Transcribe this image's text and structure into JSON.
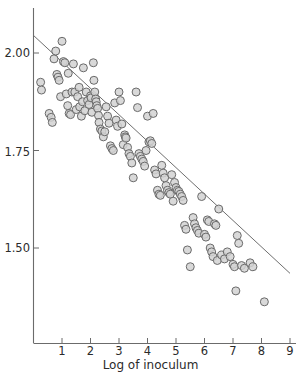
{
  "figure": {
    "background_color": "#ffffff",
    "axis_color": "#6b6b6b",
    "marker_fill": "#d2d2d2",
    "marker_stroke": "#6a6a6a",
    "fitline_color": "#6f6f6f"
  },
  "chart_data": {
    "type": "scatter",
    "title": "",
    "xlabel": "Log of inoculum",
    "ylabel": "",
    "xlim": [
      0,
      9
    ],
    "ylim": [
      1.36,
      2.08
    ],
    "grid": false,
    "legend": null,
    "xticks": [
      1,
      2,
      3,
      4,
      5,
      6,
      7,
      8,
      9
    ],
    "xtick_labels": [
      "1",
      "2",
      "3",
      "4",
      "5",
      "6",
      "7",
      "8",
      "9"
    ],
    "yticks": [
      1.5,
      1.75,
      2.0
    ],
    "ytick_labels": [
      "1.50",
      "1.75",
      "2.00"
    ],
    "series": [
      {
        "name": "observations",
        "marker": "open-circle-gray",
        "x": [
          0.25,
          0.28,
          0.55,
          0.62,
          0.66,
          0.72,
          0.78,
          0.82,
          0.86,
          0.9,
          0.95,
          1.0,
          1.05,
          1.1,
          1.15,
          1.2,
          1.22,
          1.25,
          1.3,
          1.35,
          1.4,
          1.45,
          1.5,
          1.55,
          1.6,
          1.62,
          1.68,
          1.72,
          1.75,
          1.8,
          1.85,
          1.9,
          1.95,
          2.0,
          2.02,
          2.05,
          2.1,
          2.12,
          2.15,
          2.18,
          2.2,
          2.22,
          2.25,
          2.28,
          2.3,
          2.35,
          2.4,
          2.45,
          2.5,
          2.55,
          2.6,
          2.65,
          2.7,
          2.75,
          2.8,
          2.85,
          2.9,
          2.95,
          3.0,
          3.05,
          3.1,
          3.15,
          3.2,
          3.22,
          3.25,
          3.3,
          3.35,
          3.4,
          3.45,
          3.5,
          3.6,
          3.65,
          3.7,
          3.75,
          3.8,
          3.85,
          3.9,
          3.95,
          4.0,
          4.05,
          4.1,
          4.15,
          4.2,
          4.25,
          4.3,
          4.35,
          4.4,
          4.45,
          4.5,
          4.55,
          4.6,
          4.65,
          4.7,
          4.75,
          4.8,
          4.85,
          4.9,
          4.95,
          5.0,
          5.05,
          5.1,
          5.15,
          5.2,
          5.25,
          5.3,
          5.35,
          5.4,
          5.5,
          5.6,
          5.65,
          5.7,
          5.75,
          5.8,
          5.9,
          6.0,
          6.05,
          6.1,
          6.15,
          6.2,
          6.25,
          6.3,
          6.35,
          6.4,
          6.45,
          6.5,
          6.6,
          6.7,
          6.8,
          6.9,
          7.0,
          7.05,
          7.1,
          7.15,
          7.2,
          7.3,
          7.4,
          7.6,
          7.7,
          8.1
        ],
        "y": [
          1.925,
          1.905,
          1.845,
          1.835,
          1.822,
          1.985,
          2.005,
          1.945,
          1.938,
          1.93,
          1.888,
          2.03,
          1.978,
          1.975,
          1.895,
          1.865,
          1.948,
          1.845,
          1.842,
          1.9,
          1.972,
          1.9,
          1.855,
          1.888,
          1.912,
          1.862,
          1.838,
          1.875,
          1.962,
          1.852,
          1.9,
          1.878,
          1.868,
          1.89,
          1.885,
          1.848,
          1.975,
          1.93,
          1.9,
          1.882,
          1.875,
          1.865,
          1.858,
          1.84,
          1.822,
          1.805,
          1.8,
          1.785,
          1.798,
          1.862,
          1.838,
          1.82,
          1.762,
          1.755,
          1.75,
          1.872,
          1.828,
          1.812,
          1.9,
          1.878,
          1.818,
          1.765,
          1.79,
          1.785,
          1.782,
          1.758,
          1.742,
          1.735,
          1.718,
          1.68,
          1.9,
          1.86,
          1.742,
          1.735,
          1.728,
          1.722,
          1.71,
          1.75,
          1.838,
          1.772,
          1.775,
          1.768,
          1.845,
          1.7,
          1.69,
          1.648,
          1.638,
          1.635,
          1.712,
          1.692,
          1.68,
          1.66,
          1.648,
          1.642,
          1.638,
          1.688,
          1.62,
          1.668,
          1.655,
          1.648,
          1.645,
          1.638,
          1.632,
          1.622,
          1.558,
          1.548,
          1.495,
          1.452,
          1.578,
          1.562,
          1.552,
          1.545,
          1.538,
          1.632,
          1.535,
          1.528,
          1.572,
          1.568,
          1.5,
          1.49,
          1.478,
          1.562,
          1.558,
          1.468,
          1.6,
          1.482,
          1.472,
          1.49,
          1.478,
          1.458,
          1.452,
          1.39,
          1.532,
          1.512,
          1.455,
          1.448,
          1.462,
          1.452,
          1.362
        ]
      }
    ],
    "fit_line": {
      "name": "regression-line",
      "x": [
        0.0,
        9.0
      ],
      "y": [
        2.045,
        1.435
      ]
    },
    "annotations": []
  },
  "axis": {
    "x_title": "Log of inoculum",
    "x_tick_labels": [
      "1",
      "2",
      "3",
      "4",
      "5",
      "6",
      "7",
      "8",
      "9"
    ],
    "y_tick_labels": [
      "2.00",
      "1.75",
      "1.50"
    ]
  }
}
